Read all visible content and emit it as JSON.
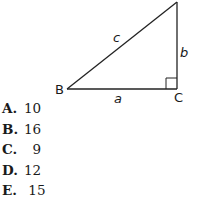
{
  "figure": {
    "vertices": {
      "B": "B",
      "C": "C",
      "A": ""
    },
    "sides": {
      "a": "a",
      "b": "b",
      "c": "c"
    },
    "right_angle_at": "C"
  },
  "choices": [
    {
      "letter": "A.",
      "value": "10"
    },
    {
      "letter": "B.",
      "value": "16"
    },
    {
      "letter": "C.",
      "value": "  9"
    },
    {
      "letter": "D.",
      "value": "12"
    },
    {
      "letter": "E.",
      "value": " 15"
    }
  ]
}
